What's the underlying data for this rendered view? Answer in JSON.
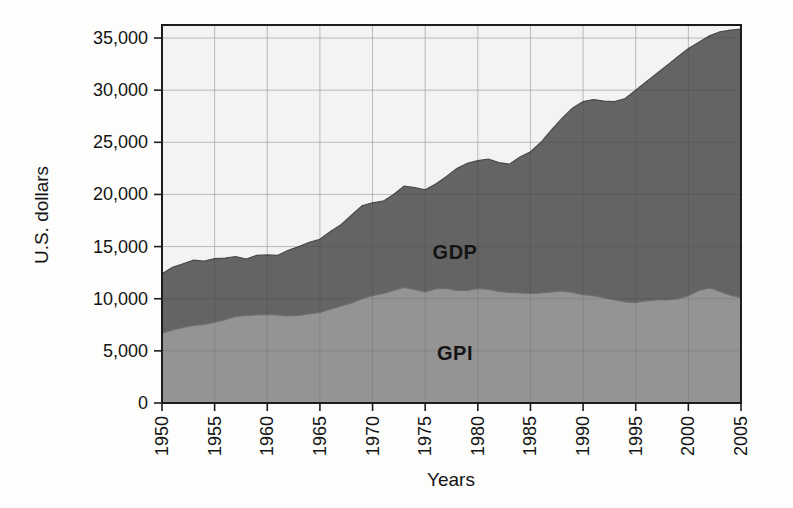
{
  "chart_data": {
    "type": "area",
    "title": "",
    "xlabel": "Years",
    "ylabel": "U.S. dollars",
    "xlim": [
      1950,
      2005
    ],
    "ylim": [
      0,
      36250
    ],
    "grid": true,
    "legend": "inline-labels",
    "x_ticks": [
      1950,
      1955,
      1960,
      1965,
      1970,
      1975,
      1980,
      1985,
      1990,
      1995,
      2000,
      2005
    ],
    "y_ticks": [
      {
        "value": 0,
        "label": "0"
      },
      {
        "value": 5000,
        "label": "5,000"
      },
      {
        "value": 10000,
        "label": "10,000"
      },
      {
        "value": 15000,
        "label": "15,000"
      },
      {
        "value": 20000,
        "label": "20,000"
      },
      {
        "value": 25000,
        "label": "25,000"
      },
      {
        "value": 30000,
        "label": "30,000"
      },
      {
        "value": 35000,
        "label": "35,000"
      }
    ],
    "x": [
      1950,
      1951,
      1952,
      1953,
      1954,
      1955,
      1956,
      1957,
      1958,
      1959,
      1960,
      1961,
      1962,
      1963,
      1964,
      1965,
      1966,
      1967,
      1968,
      1969,
      1970,
      1971,
      1972,
      1973,
      1974,
      1975,
      1976,
      1977,
      1978,
      1979,
      1980,
      1981,
      1982,
      1983,
      1984,
      1985,
      1986,
      1987,
      1988,
      1989,
      1990,
      1991,
      1992,
      1993,
      1994,
      1995,
      1996,
      1997,
      1998,
      1999,
      2000,
      2001,
      2002,
      2003,
      2004,
      2005
    ],
    "series": [
      {
        "name": "GDP",
        "color": "#646464",
        "edge_color": "#4a4a4a",
        "values": [
          12400,
          13000,
          13350,
          13700,
          13600,
          13850,
          13900,
          14050,
          13800,
          14150,
          14200,
          14150,
          14650,
          15000,
          15400,
          15700,
          16450,
          17100,
          18000,
          18900,
          19200,
          19350,
          20000,
          20800,
          20650,
          20450,
          21000,
          21700,
          22500,
          23000,
          23250,
          23400,
          23050,
          22900,
          23600,
          24100,
          25000,
          26200,
          27300,
          28300,
          28900,
          29100,
          28950,
          28900,
          29200,
          30000,
          30800,
          31600,
          32400,
          33200,
          34000,
          34600,
          35200,
          35600,
          35750,
          35850
        ]
      },
      {
        "name": "GPI",
        "color": "#949494",
        "edge_color": "#6e6e6e",
        "values": [
          6700,
          7000,
          7250,
          7450,
          7550,
          7750,
          8000,
          8300,
          8400,
          8450,
          8500,
          8450,
          8350,
          8400,
          8550,
          8700,
          9000,
          9300,
          9600,
          10000,
          10300,
          10500,
          10800,
          11100,
          10900,
          10650,
          10950,
          11000,
          10800,
          10800,
          11000,
          10900,
          10700,
          10600,
          10550,
          10500,
          10550,
          10650,
          10750,
          10600,
          10400,
          10300,
          10100,
          9900,
          9700,
          9650,
          9800,
          9900,
          9900,
          10000,
          10300,
          10800,
          11050,
          10700,
          10350,
          10100
        ]
      }
    ],
    "inline_labels": [
      {
        "text": "GDP",
        "series": "GDP",
        "x": 455,
        "y": 259
      },
      {
        "text": "GPI",
        "series": "GPI",
        "x": 455,
        "y": 360
      }
    ],
    "colors": {
      "plot_background": "#f4f3f1",
      "gridline": "#cfcfcf",
      "frame": "#1c1c1c",
      "text": "#141414"
    }
  }
}
